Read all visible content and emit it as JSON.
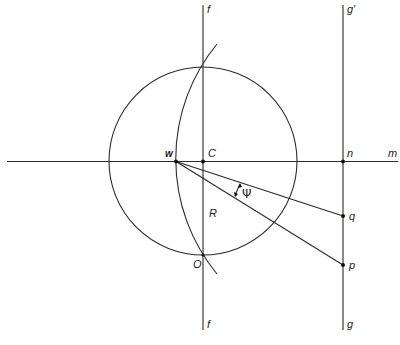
{
  "diagram": {
    "type": "geometric-construction",
    "labels": {
      "f_top": "f",
      "f_bottom": "f",
      "g_prime": "g'",
      "g": "g",
      "m": "m",
      "w": "w",
      "C": "C",
      "n": "n",
      "R": "R",
      "O": "O",
      "q": "q",
      "p": "p",
      "psi": "Ψ"
    },
    "elements": {
      "circle": {
        "center": "C",
        "radius_label": "R"
      },
      "line_m": "horizontal line through w, C, n",
      "line_f": "vertical line through C and O",
      "line_g": "vertical line through n, q, p",
      "arc": "arc through circle top, w and O",
      "rays": [
        "w to q",
        "w to p"
      ],
      "angle": "Ψ between rays wq and wp"
    }
  }
}
